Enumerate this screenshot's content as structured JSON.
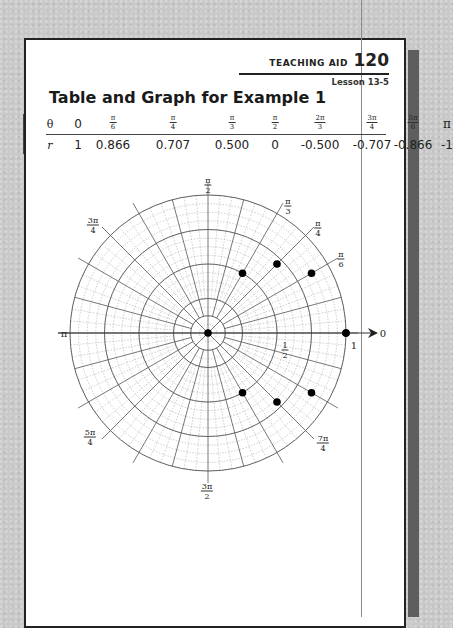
{
  "header": {
    "aid_label": "TEACHING AID",
    "aid_number": "120",
    "lesson": "Lesson 13-5"
  },
  "title": "Table and Graph for Example 1",
  "table": {
    "theta_label": "θ",
    "r_label": "r",
    "columns": [
      {
        "theta_num": "0",
        "theta_den": "",
        "r": "1",
        "x": 12
      },
      {
        "theta_num": "π",
        "theta_den": "6",
        "r": "0.866",
        "x": 47
      },
      {
        "theta_num": "π",
        "theta_den": "4",
        "r": "0.707",
        "x": 107
      },
      {
        "theta_num": "π",
        "theta_den": "3",
        "r": "0.500",
        "x": 166
      },
      {
        "theta_num": "π",
        "theta_den": "2",
        "r": "0",
        "x": 209
      },
      {
        "theta_num": "2π",
        "theta_den": "3",
        "r": "-0.500",
        "x": 254
      },
      {
        "theta_num": "3π",
        "theta_den": "4",
        "r": "-0.707",
        "x": 306
      },
      {
        "theta_num": "5π",
        "theta_den": "6",
        "r": "-0.866",
        "x": 347
      },
      {
        "theta_num": "π",
        "theta_den": "",
        "r": "-1",
        "x": 381
      }
    ]
  },
  "graph": {
    "center": [
      208,
      333
    ],
    "radius": 138,
    "major_rings": [
      0.125,
      0.25,
      0.5,
      0.75,
      1.0
    ],
    "minor_ring_step": 0.0625,
    "major_radial_step_deg": 15,
    "minor_radial_step_deg": 5,
    "point_color": "#000000",
    "grid_color": "#555555",
    "angle_labels": [
      {
        "num": "π",
        "den": "2",
        "x": 208,
        "y": 185
      },
      {
        "num": "π",
        "den": "3",
        "x": 288,
        "y": 206
      },
      {
        "num": "π",
        "den": "4",
        "x": 318,
        "y": 228
      },
      {
        "num": "π",
        "den": "6",
        "x": 341,
        "y": 259
      },
      {
        "num": "3π",
        "den": "4",
        "x": 93,
        "y": 225
      },
      {
        "num": "π",
        "den": "",
        "x": 64,
        "y": 333
      },
      {
        "num": "5π",
        "den": "4",
        "x": 90,
        "y": 437
      },
      {
        "num": "3π",
        "den": "2",
        "x": 207,
        "y": 491
      },
      {
        "num": "7π",
        "den": "4",
        "x": 323,
        "y": 443
      }
    ],
    "radius_labels": [
      {
        "num": "1",
        "den": "2",
        "x": 285,
        "y": 350
      },
      {
        "num": "1",
        "den": "",
        "x": 354,
        "y": 345
      }
    ],
    "axis_zero_label": {
      "text": "0",
      "x": 383,
      "y": 333
    }
  },
  "chart_data": {
    "type": "scatter",
    "title": "Table and Graph for Example 1",
    "coordinate_system": "polar",
    "xlabel": "θ",
    "ylabel": "r",
    "theta_labels": [
      "0",
      "π/6",
      "π/4",
      "π/3",
      "π/2",
      "2π/3",
      "3π/4",
      "5π/6",
      "π"
    ],
    "theta": [
      0,
      0.5236,
      0.7854,
      1.0472,
      1.5708,
      2.0944,
      2.3562,
      2.618,
      3.1416
    ],
    "r": [
      1,
      0.866,
      0.707,
      0.5,
      0,
      -0.5,
      -0.707,
      -0.866,
      -1
    ],
    "rlim": [
      0,
      1
    ],
    "angle_tick_labels": [
      "0",
      "π/6",
      "π/4",
      "π/3",
      "π/2",
      "3π/4",
      "π",
      "5π/4",
      "3π/2",
      "7π/4"
    ],
    "radial_tick_labels": [
      "1/2",
      "1"
    ],
    "grid": true
  }
}
